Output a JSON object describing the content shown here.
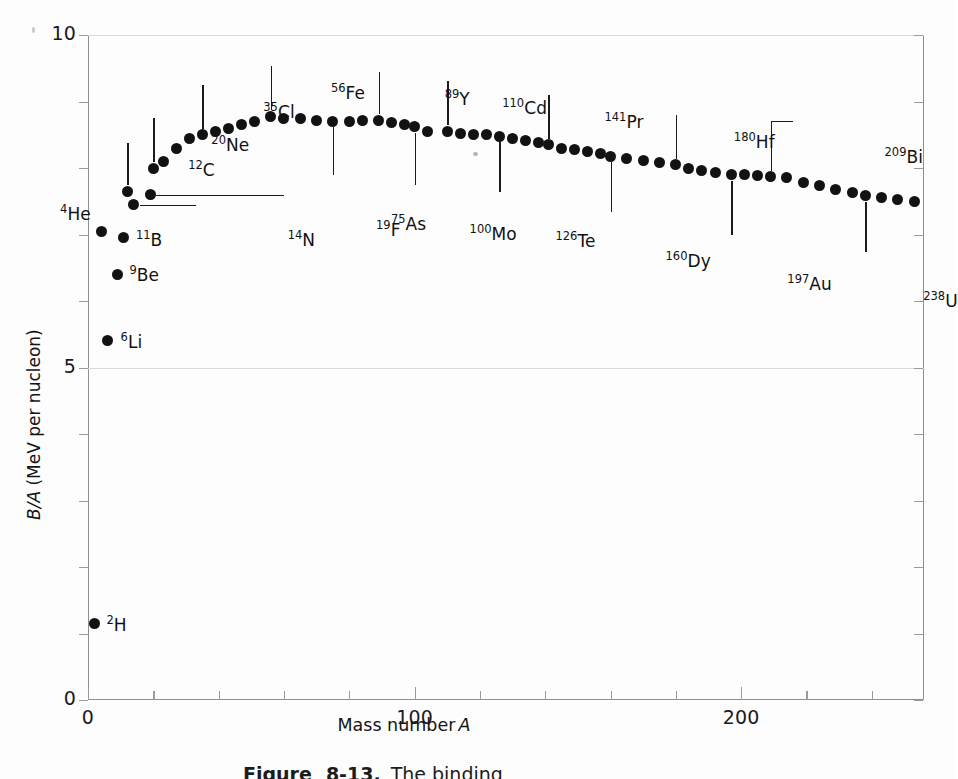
{
  "figure": {
    "caption_fragment": "Figure   8-13.   The binding",
    "caption_label": "Figure",
    "caption_number": "8-13.",
    "caption_text": "The binding"
  },
  "axes": {
    "x": {
      "title": "Mass number",
      "title_symbol": "A",
      "ticks": [
        0,
        20,
        40,
        60,
        80,
        100,
        120,
        140,
        160,
        180,
        200,
        220,
        240
      ],
      "labeled_ticks": [
        {
          "value": 0,
          "label": "0"
        },
        {
          "value": 100,
          "label": "100"
        },
        {
          "value": 200,
          "label": "200"
        }
      ],
      "min": 0,
      "max": 256
    },
    "y": {
      "title": "B/A",
      "title_units": "(MeV per nucleon)",
      "title_full": "B/A (MeV per nucleon)",
      "ticks": [
        0,
        1,
        2,
        3,
        4,
        5,
        6,
        7,
        8,
        9,
        10
      ],
      "labeled_ticks": [
        {
          "value": 0,
          "label": "0"
        },
        {
          "value": 5,
          "label": "5"
        },
        {
          "value": 10,
          "label": "10"
        }
      ],
      "min": 0,
      "max": 10,
      "gridlines_at": [
        5,
        10
      ]
    }
  },
  "chart_data": {
    "type": "scatter",
    "title": "",
    "xlabel": "Mass number A",
    "ylabel": "B/A (MeV per nucleon)",
    "xlim": [
      0,
      256
    ],
    "ylim": [
      0,
      10
    ],
    "grid": true,
    "legend": "none",
    "marker": "filled-circle",
    "marker_color": "#121212",
    "points": [
      {
        "x": 2,
        "y": 1.15,
        "label": "2H",
        "sup": "2",
        "sym": "H"
      },
      {
        "x": 4,
        "y": 7.05,
        "label": "4He",
        "sup": "4",
        "sym": "He"
      },
      {
        "x": 6,
        "y": 5.4,
        "label": "6Li",
        "sup": "6",
        "sym": "Li"
      },
      {
        "x": 9,
        "y": 6.4,
        "label": "9Be",
        "sup": "9",
        "sym": "Be"
      },
      {
        "x": 11,
        "y": 6.95,
        "label": "11B",
        "sup": "11",
        "sym": "B"
      },
      {
        "x": 12,
        "y": 7.65,
        "label": "12C",
        "sup": "12",
        "sym": "C"
      },
      {
        "x": 14,
        "y": 7.45,
        "label": "14N",
        "sup": "14",
        "sym": "N"
      },
      {
        "x": 19,
        "y": 7.6,
        "label": "19F",
        "sup": "19",
        "sym": "F"
      },
      {
        "x": 20,
        "y": 8.0,
        "label": "20Ne",
        "sup": "20",
        "sym": "Ne"
      },
      {
        "x": 23,
        "y": 8.1,
        "label": null
      },
      {
        "x": 27,
        "y": 8.3,
        "label": null
      },
      {
        "x": 31,
        "y": 8.45,
        "label": null
      },
      {
        "x": 35,
        "y": 8.5,
        "label": "35Cl",
        "sup": "35",
        "sym": "Cl"
      },
      {
        "x": 39,
        "y": 8.55,
        "label": null
      },
      {
        "x": 43,
        "y": 8.6,
        "label": null
      },
      {
        "x": 47,
        "y": 8.65,
        "label": null
      },
      {
        "x": 51,
        "y": 8.7,
        "label": null
      },
      {
        "x": 56,
        "y": 8.78,
        "label": "56Fe",
        "sup": "56",
        "sym": "Fe"
      },
      {
        "x": 60,
        "y": 8.75,
        "label": null
      },
      {
        "x": 65,
        "y": 8.75,
        "label": null
      },
      {
        "x": 70,
        "y": 8.72,
        "label": null
      },
      {
        "x": 75,
        "y": 8.7,
        "label": "75As",
        "sup": "75",
        "sym": "As"
      },
      {
        "x": 80,
        "y": 8.7,
        "label": null
      },
      {
        "x": 84,
        "y": 8.72,
        "label": null
      },
      {
        "x": 89,
        "y": 8.72,
        "label": "89Y",
        "sup": "89",
        "sym": "Y"
      },
      {
        "x": 93,
        "y": 8.68,
        "label": null
      },
      {
        "x": 97,
        "y": 8.65,
        "label": null
      },
      {
        "x": 100,
        "y": 8.62,
        "label": "100Mo",
        "sup": "100",
        "sym": "Mo"
      },
      {
        "x": 104,
        "y": 8.55,
        "label": null
      },
      {
        "x": 110,
        "y": 8.55,
        "label": "110Cd",
        "sup": "110",
        "sym": "Cd"
      },
      {
        "x": 114,
        "y": 8.52,
        "label": null
      },
      {
        "x": 118,
        "y": 8.5,
        "label": null
      },
      {
        "x": 122,
        "y": 8.5,
        "label": null
      },
      {
        "x": 126,
        "y": 8.48,
        "label": "126Te",
        "sup": "126",
        "sym": "Te"
      },
      {
        "x": 130,
        "y": 8.45,
        "label": null
      },
      {
        "x": 134,
        "y": 8.42,
        "label": null
      },
      {
        "x": 138,
        "y": 8.38,
        "label": null
      },
      {
        "x": 141,
        "y": 8.35,
        "label": "141Pr",
        "sup": "141",
        "sym": "Pr"
      },
      {
        "x": 145,
        "y": 8.3,
        "label": null
      },
      {
        "x": 149,
        "y": 8.28,
        "label": null
      },
      {
        "x": 153,
        "y": 8.25,
        "label": null
      },
      {
        "x": 157,
        "y": 8.22,
        "label": null
      },
      {
        "x": 160,
        "y": 8.18,
        "label": "160Dy",
        "sup": "160",
        "sym": "Dy"
      },
      {
        "x": 165,
        "y": 8.15,
        "label": null
      },
      {
        "x": 170,
        "y": 8.12,
        "label": null
      },
      {
        "x": 175,
        "y": 8.08,
        "label": null
      },
      {
        "x": 180,
        "y": 8.05,
        "label": "180Hf",
        "sup": "180",
        "sym": "Hf"
      },
      {
        "x": 184,
        "y": 8.0,
        "label": null
      },
      {
        "x": 188,
        "y": 7.96,
        "label": null
      },
      {
        "x": 192,
        "y": 7.93,
        "label": null
      },
      {
        "x": 197,
        "y": 7.9,
        "label": "197Au",
        "sup": "197",
        "sym": "Au"
      },
      {
        "x": 201,
        "y": 7.9,
        "label": null
      },
      {
        "x": 205,
        "y": 7.88,
        "label": null
      },
      {
        "x": 209,
        "y": 7.87,
        "label": "209Bi",
        "sup": "209",
        "sym": "Bi"
      },
      {
        "x": 214,
        "y": 7.85,
        "label": null
      },
      {
        "x": 219,
        "y": 7.78,
        "label": null
      },
      {
        "x": 224,
        "y": 7.73,
        "label": null
      },
      {
        "x": 229,
        "y": 7.68,
        "label": null
      },
      {
        "x": 234,
        "y": 7.63,
        "label": null
      },
      {
        "x": 238,
        "y": 7.58,
        "label": "238U",
        "sup": "238",
        "sym": "U"
      },
      {
        "x": 243,
        "y": 7.55,
        "label": null
      },
      {
        "x": 248,
        "y": 7.53,
        "label": null
      },
      {
        "x": 253,
        "y": 7.5,
        "label": null
      }
    ],
    "annotations": [
      {
        "label": "2H",
        "sup": "2",
        "sym": "H",
        "side": "right"
      },
      {
        "label": "4He",
        "sup": "4",
        "sym": "He",
        "side": "above-left"
      },
      {
        "label": "6Li",
        "sup": "6",
        "sym": "Li",
        "side": "right"
      },
      {
        "label": "9Be",
        "sup": "9",
        "sym": "Be",
        "side": "right"
      },
      {
        "label": "11B",
        "sup": "11",
        "sym": "B",
        "side": "right"
      },
      {
        "label": "12C",
        "sup": "12",
        "sym": "C",
        "side": "above"
      },
      {
        "label": "14N",
        "sup": "14",
        "sym": "N",
        "side": "right-leader"
      },
      {
        "label": "19F",
        "sup": "19",
        "sym": "F",
        "side": "right-leader"
      },
      {
        "label": "20Ne",
        "sup": "20",
        "sym": "Ne",
        "side": "above"
      },
      {
        "label": "35Cl",
        "sup": "35",
        "sym": "Cl",
        "side": "above"
      },
      {
        "label": "56Fe",
        "sup": "56",
        "sym": "Fe",
        "side": "above"
      },
      {
        "label": "75As",
        "sup": "75",
        "sym": "As",
        "side": "below"
      },
      {
        "label": "89Y",
        "sup": "89",
        "sym": "Y",
        "side": "above"
      },
      {
        "label": "100Mo",
        "sup": "100",
        "sym": "Mo",
        "side": "below"
      },
      {
        "label": "110Cd",
        "sup": "110",
        "sym": "Cd",
        "side": "above"
      },
      {
        "label": "126Te",
        "sup": "126",
        "sym": "Te",
        "side": "below"
      },
      {
        "label": "141Pr",
        "sup": "141",
        "sym": "Pr",
        "side": "above"
      },
      {
        "label": "160Dy",
        "sup": "160",
        "sym": "Dy",
        "side": "below"
      },
      {
        "label": "180Hf",
        "sup": "180",
        "sym": "Hf",
        "side": "above"
      },
      {
        "label": "197Au",
        "sup": "197",
        "sym": "Au",
        "side": "below"
      },
      {
        "label": "209Bi",
        "sup": "209",
        "sym": "Bi",
        "side": "above-right"
      },
      {
        "label": "238U",
        "sup": "238",
        "sym": "U",
        "side": "below"
      }
    ]
  }
}
